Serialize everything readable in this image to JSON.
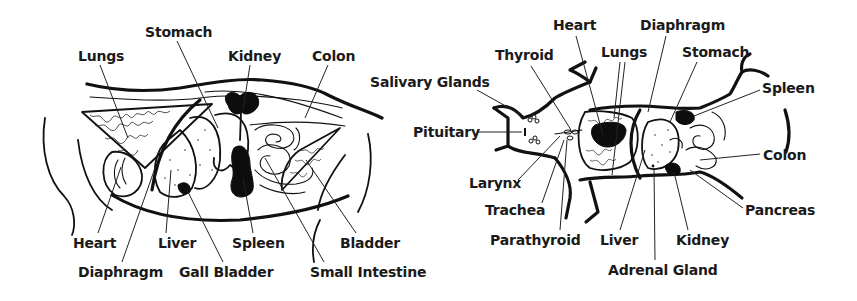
{
  "figure": {
    "panels": [
      {
        "id": "lateral-view",
        "description": "Cat internal organs, side (lateral) view",
        "labels": [
          {
            "key": "lungs",
            "text": "Lungs",
            "x": 78,
            "y": 48
          },
          {
            "key": "stomach",
            "text": "Stomach",
            "x": 145,
            "y": 24
          },
          {
            "key": "kidney",
            "text": "Kidney",
            "x": 228,
            "y": 48
          },
          {
            "key": "colon",
            "text": "Colon",
            "x": 312,
            "y": 48
          },
          {
            "key": "heart",
            "text": "Heart",
            "x": 73,
            "y": 235
          },
          {
            "key": "liver",
            "text": "Liver",
            "x": 158,
            "y": 235
          },
          {
            "key": "spleen",
            "text": "Spleen",
            "x": 232,
            "y": 235
          },
          {
            "key": "bladder",
            "text": "Bladder",
            "x": 340,
            "y": 235
          },
          {
            "key": "diaphragm",
            "text": "Diaphragm",
            "x": 78,
            "y": 264
          },
          {
            "key": "gall-bladder",
            "text": "Gall Bladder",
            "x": 179,
            "y": 264
          },
          {
            "key": "small-intestine",
            "text": "Small Intestine",
            "x": 310,
            "y": 264
          }
        ]
      },
      {
        "id": "ventral-view",
        "description": "Cat internal organs, underside (ventral) view",
        "labels": [
          {
            "key": "heart",
            "text": "Heart",
            "x": 553,
            "y": 17
          },
          {
            "key": "diaphragm",
            "text": "Diaphragm",
            "x": 640,
            "y": 17
          },
          {
            "key": "thyroid",
            "text": "Thyroid",
            "x": 495,
            "y": 47
          },
          {
            "key": "lungs",
            "text": "Lungs",
            "x": 601,
            "y": 44
          },
          {
            "key": "stomach",
            "text": "Stomach",
            "x": 682,
            "y": 44
          },
          {
            "key": "salivary-glands",
            "text": "Salivary Glands",
            "x": 370,
            "y": 74
          },
          {
            "key": "spleen",
            "text": "Spleen",
            "x": 762,
            "y": 80
          },
          {
            "key": "pituitary",
            "text": "Pituitary",
            "x": 413,
            "y": 124
          },
          {
            "key": "colon",
            "text": "Colon",
            "x": 763,
            "y": 147
          },
          {
            "key": "larynx",
            "text": "Larynx",
            "x": 469,
            "y": 175
          },
          {
            "key": "trachea",
            "text": "Trachea",
            "x": 485,
            "y": 202
          },
          {
            "key": "pancreas",
            "text": "Pancreas",
            "x": 745,
            "y": 202
          },
          {
            "key": "parathyroid",
            "text": "Parathyroid",
            "x": 490,
            "y": 232
          },
          {
            "key": "liver",
            "text": "Liver",
            "x": 600,
            "y": 232
          },
          {
            "key": "kidney",
            "text": "Kidney",
            "x": 676,
            "y": 232
          },
          {
            "key": "adrenal-gland",
            "text": "Adrenal Gland",
            "x": 608,
            "y": 262
          }
        ]
      }
    ]
  }
}
